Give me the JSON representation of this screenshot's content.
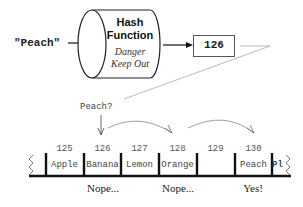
{
  "input_key": "\"Peach\"",
  "hash_function": {
    "title_line1": "Hash",
    "title_line2": "Function",
    "subtitle_line1": "Danger",
    "subtitle_line2": "Keep Out"
  },
  "hash_output": "126",
  "query_label": "Peach?",
  "table": {
    "slots": [
      {
        "index": "125",
        "value": "Apple"
      },
      {
        "index": "126",
        "value": "Banana"
      },
      {
        "index": "127",
        "value": "Lemon"
      },
      {
        "index": "128",
        "value": "Orange"
      },
      {
        "index": "129",
        "value": ""
      },
      {
        "index": "130",
        "value": "Peach"
      },
      {
        "index": "",
        "value": "Pl"
      }
    ]
  },
  "probe_results": [
    "Nope...",
    "Nope...",
    "Yes!"
  ],
  "colors": {
    "line": "#111111",
    "arrow_gray": "#888888",
    "text": "#333333"
  }
}
